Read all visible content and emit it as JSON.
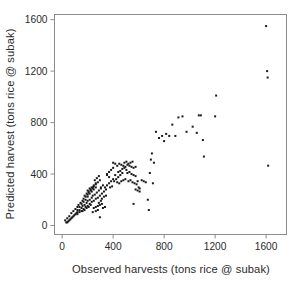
{
  "chart_data": {
    "type": "scatter",
    "title": "",
    "xlabel": "Observed harvests (tons rice @ subak)",
    "ylabel": "Predicted harvest (tons rice @ subak)",
    "xlim": [
      -60,
      1760
    ],
    "ylim": [
      -70,
      1640
    ],
    "xticks": [
      0,
      400,
      800,
      1200,
      1600
    ],
    "yticks": [
      0,
      400,
      800,
      1200,
      1600
    ],
    "xtick_labels": [
      "0",
      "400",
      "800",
      "1200",
      "1600"
    ],
    "ytick_labels": [
      "0",
      "400",
      "800",
      "1200",
      "1600"
    ],
    "grid": false,
    "legend": false,
    "marker": "square",
    "marker_color": "#1a1a1a",
    "marker_size": 2,
    "frame_color": "#8d8d8d",
    "background_color": "#ffffff",
    "series": [
      {
        "name": "subak harvests",
        "points": [
          [
            24,
            40
          ],
          [
            32,
            24
          ],
          [
            40,
            56
          ],
          [
            48,
            32
          ],
          [
            56,
            72
          ],
          [
            64,
            48
          ],
          [
            72,
            96
          ],
          [
            80,
            64
          ],
          [
            88,
            112
          ],
          [
            96,
            80
          ],
          [
            104,
            128
          ],
          [
            112,
            96
          ],
          [
            120,
            144
          ],
          [
            120,
            104
          ],
          [
            128,
            160
          ],
          [
            136,
            120
          ],
          [
            144,
            176
          ],
          [
            152,
            136
          ],
          [
            160,
            192
          ],
          [
            160,
            152
          ],
          [
            168,
            208
          ],
          [
            176,
            160
          ],
          [
            184,
            224
          ],
          [
            192,
            176
          ],
          [
            200,
            240
          ],
          [
            200,
            192
          ],
          [
            208,
            256
          ],
          [
            216,
            200
          ],
          [
            224,
            272
          ],
          [
            232,
            216
          ],
          [
            240,
            288
          ],
          [
            240,
            232
          ],
          [
            248,
            304
          ],
          [
            256,
            240
          ],
          [
            264,
            320
          ],
          [
            272,
            256
          ],
          [
            280,
            336
          ],
          [
            288,
            272
          ],
          [
            296,
            352
          ],
          [
            304,
            288
          ],
          [
            40,
            24
          ],
          [
            56,
            40
          ],
          [
            72,
            56
          ],
          [
            88,
            72
          ],
          [
            104,
            88
          ],
          [
            120,
            120
          ],
          [
            136,
            144
          ],
          [
            152,
            168
          ],
          [
            168,
            184
          ],
          [
            184,
            200
          ],
          [
            200,
            224
          ],
          [
            216,
            248
          ],
          [
            232,
            264
          ],
          [
            248,
            280
          ],
          [
            264,
            296
          ],
          [
            120,
            88
          ],
          [
            136,
            104
          ],
          [
            152,
            112
          ],
          [
            168,
            128
          ],
          [
            184,
            144
          ],
          [
            200,
            152
          ],
          [
            216,
            168
          ],
          [
            232,
            184
          ],
          [
            248,
            192
          ],
          [
            264,
            208
          ],
          [
            176,
            232
          ],
          [
            192,
            248
          ],
          [
            208,
            264
          ],
          [
            224,
            280
          ],
          [
            240,
            296
          ],
          [
            160,
            112
          ],
          [
            176,
            120
          ],
          [
            192,
            136
          ],
          [
            208,
            144
          ],
          [
            224,
            160
          ],
          [
            248,
            136
          ],
          [
            264,
            144
          ],
          [
            280,
            152
          ],
          [
            296,
            160
          ],
          [
            312,
            168
          ],
          [
            200,
            272
          ],
          [
            216,
            288
          ],
          [
            232,
            296
          ],
          [
            248,
            312
          ],
          [
            264,
            328
          ],
          [
            280,
            216
          ],
          [
            296,
            232
          ],
          [
            312,
            248
          ],
          [
            328,
            264
          ],
          [
            344,
            280
          ],
          [
            256,
            352
          ],
          [
            272,
            368
          ],
          [
            288,
            384
          ],
          [
            304,
            296
          ],
          [
            320,
            312
          ],
          [
            288,
            176
          ],
          [
            304,
            192
          ],
          [
            312,
            208
          ],
          [
            328,
            224
          ],
          [
            344,
            232
          ],
          [
            336,
            296
          ],
          [
            352,
            312
          ],
          [
            368,
            328
          ],
          [
            384,
            344
          ],
          [
            400,
            360
          ],
          [
            352,
            400
          ],
          [
            368,
            416
          ],
          [
            384,
            432
          ],
          [
            400,
            448
          ],
          [
            416,
            392
          ],
          [
            408,
            344
          ],
          [
            424,
            360
          ],
          [
            440,
            376
          ],
          [
            456,
            392
          ],
          [
            472,
            408
          ],
          [
            432,
            464
          ],
          [
            448,
            480
          ],
          [
            464,
            472
          ],
          [
            480,
            464
          ],
          [
            496,
            456
          ],
          [
            440,
            416
          ],
          [
            456,
            424
          ],
          [
            472,
            440
          ],
          [
            488,
            448
          ],
          [
            504,
            432
          ],
          [
            488,
            488
          ],
          [
            504,
            496
          ],
          [
            520,
            480
          ],
          [
            536,
            488
          ],
          [
            552,
            496
          ],
          [
            512,
            408
          ],
          [
            528,
            416
          ],
          [
            544,
            400
          ],
          [
            560,
            392
          ],
          [
            576,
            384
          ],
          [
            520,
            344
          ],
          [
            536,
            352
          ],
          [
            552,
            336
          ],
          [
            568,
            328
          ],
          [
            584,
            320
          ],
          [
            560,
            448
          ],
          [
            576,
            456
          ],
          [
            592,
            344
          ],
          [
            600,
            296
          ],
          [
            608,
            288
          ],
          [
            296,
            64
          ],
          [
            320,
            136
          ],
          [
            336,
            144
          ],
          [
            352,
            392
          ],
          [
            368,
            376
          ],
          [
            376,
            296
          ],
          [
            392,
            304
          ],
          [
            264,
            112
          ],
          [
            280,
            120
          ],
          [
            240,
            104
          ],
          [
            400,
            488
          ],
          [
            416,
            480
          ],
          [
            432,
            336
          ],
          [
            448,
            328
          ],
          [
            464,
            344
          ],
          [
            480,
            352
          ],
          [
            496,
            360
          ],
          [
            512,
            472
          ],
          [
            528,
            464
          ],
          [
            544,
            456
          ],
          [
            560,
            168
          ],
          [
            576,
            280
          ],
          [
            592,
            272
          ],
          [
            608,
            264
          ],
          [
            624,
            352
          ],
          [
            640,
            344
          ],
          [
            656,
            336
          ],
          [
            672,
            200
          ],
          [
            680,
            120
          ],
          [
            688,
            408
          ],
          [
            696,
            512
          ],
          [
            704,
            560
          ],
          [
            712,
            328
          ],
          [
            720,
            488
          ],
          [
            736,
            728
          ],
          [
            760,
            680
          ],
          [
            784,
            696
          ],
          [
            800,
            656
          ],
          [
            816,
            712
          ],
          [
            840,
            696
          ],
          [
            864,
            784
          ],
          [
            888,
            696
          ],
          [
            912,
            840
          ],
          [
            944,
            848
          ],
          [
            976,
            728
          ],
          [
            1024,
            768
          ],
          [
            1056,
            720
          ],
          [
            1072,
            856
          ],
          [
            1088,
            856
          ],
          [
            1104,
            664
          ],
          [
            1112,
            536
          ],
          [
            1200,
            848
          ],
          [
            1208,
            1010
          ],
          [
            1600,
            1550
          ],
          [
            1608,
            1200
          ],
          [
            1612,
            1150
          ],
          [
            1616,
            465
          ]
        ]
      }
    ]
  }
}
